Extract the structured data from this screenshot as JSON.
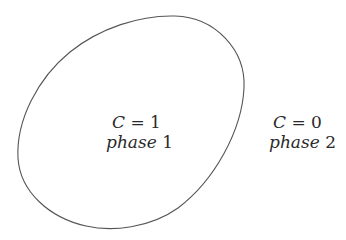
{
  "diagram": {
    "type": "phase-field region illustration",
    "colors": {
      "background": "#ffffff",
      "boundary_stroke": "#555555",
      "text": "#2a2a2a"
    },
    "regions": [
      {
        "id": "inside",
        "equation_var": "C",
        "equation_op": " = ",
        "equation_value": "1",
        "phase_word": "phase",
        "phase_number": " 1"
      },
      {
        "id": "outside",
        "equation_var": "C",
        "equation_op": " = ",
        "equation_value": "0",
        "phase_word": "phase",
        "phase_number": " 2"
      }
    ]
  }
}
